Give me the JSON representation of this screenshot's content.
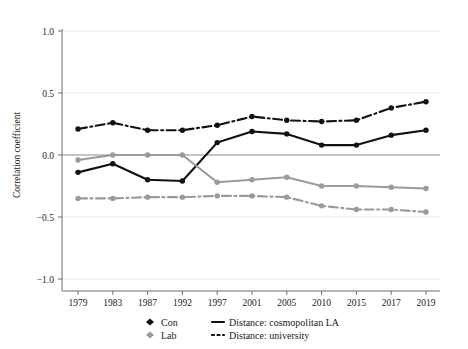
{
  "chart_data": {
    "type": "line",
    "title": "",
    "xlabel": "",
    "ylabel": "Correlation coefficient",
    "categories": [
      "1979",
      "1983",
      "1987",
      "1992",
      "1997",
      "2001",
      "2005",
      "2010",
      "2015",
      "2017",
      "2019"
    ],
    "ylim": [
      -1.0,
      1.0
    ],
    "ytick_labels": [
      "1.0",
      "0.5",
      "0.0",
      "-0.5",
      "-1.0"
    ],
    "ytick_values": [
      1.0,
      0.5,
      0.0,
      -0.5,
      -1.0
    ],
    "grid": true,
    "legend_position": "bottom",
    "series": [
      {
        "name": "Con - Distance: cosmopolitan LA",
        "party": "Con",
        "distance": "cosmopolitan LA",
        "color": "#111111",
        "style": "solid",
        "marker": "circle",
        "values": [
          -0.14,
          -0.07,
          -0.2,
          -0.21,
          0.1,
          0.19,
          0.17,
          0.08,
          0.08,
          0.16,
          0.2
        ]
      },
      {
        "name": "Con - Distance: university",
        "party": "Con",
        "distance": "university",
        "color": "#111111",
        "style": "dash-dot",
        "marker": "circle",
        "values": [
          0.21,
          0.26,
          0.2,
          0.2,
          0.24,
          0.31,
          0.28,
          0.27,
          0.28,
          0.38,
          0.43
        ]
      },
      {
        "name": "Lab - Distance: cosmopolitan LA",
        "party": "Lab",
        "distance": "cosmopolitan LA",
        "color": "#9a9a9a",
        "style": "solid",
        "marker": "circle",
        "values": [
          -0.04,
          0.0,
          0.0,
          0.0,
          -0.22,
          -0.2,
          -0.18,
          -0.25,
          -0.25,
          -0.26,
          -0.27
        ]
      },
      {
        "name": "Lab - Distance: university",
        "party": "Lab",
        "distance": "university",
        "color": "#9a9a9a",
        "style": "dash-dot",
        "marker": "circle",
        "values": [
          -0.35,
          -0.35,
          -0.34,
          -0.34,
          -0.33,
          -0.33,
          -0.34,
          -0.41,
          -0.44,
          -0.44,
          -0.46
        ]
      }
    ]
  },
  "legend": {
    "items": [
      {
        "label": "Con",
        "kind": "marker",
        "color": "#111111"
      },
      {
        "label": "Lab",
        "kind": "marker",
        "color": "#9a9a9a"
      },
      {
        "label": "Distance: cosmopolitan LA",
        "kind": "line-solid",
        "color": "#111111"
      },
      {
        "label": "Distance: university",
        "kind": "line-dotted",
        "color": "#111111"
      }
    ]
  }
}
